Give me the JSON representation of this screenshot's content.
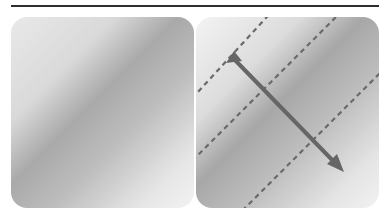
{
  "figure": {
    "title": "",
    "panels": [
      {
        "id": "left",
        "content": "diagonal-gradient"
      },
      {
        "id": "right",
        "content": "diagonal-gradient-with-direction-arrow"
      }
    ],
    "colors": {
      "rule": "#2e2e2e",
      "gradient_light": "#f2f2f2",
      "gradient_dark": "#a8a8a8",
      "dashed_line": "#6a6a6a",
      "arrow": "#666666"
    },
    "overlay": {
      "dashed_lines": 3,
      "arrow_direction": "top-left to bottom-right"
    }
  }
}
